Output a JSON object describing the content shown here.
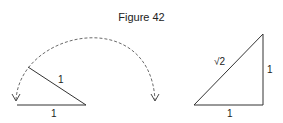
{
  "figure": {
    "title": "Figure 42",
    "left_diagram": {
      "base_label": "1",
      "rotated_segment_label": "1"
    },
    "right_diagram": {
      "hypotenuse_label": "√2",
      "vertical_leg_label": "1",
      "base_label": "1"
    },
    "line_color": "#333333"
  }
}
